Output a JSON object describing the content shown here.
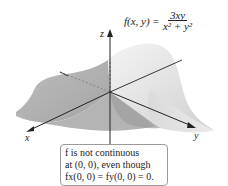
{
  "figure": {
    "title_formula": {
      "lhs": "f(x, y)",
      "eq": "=",
      "numerator": "3xy",
      "denominator": "x² + y²"
    },
    "axes": {
      "x": "x",
      "y": "y",
      "z": "z"
    },
    "caption": {
      "line1": "f is not continuous",
      "line2": "at (0, 0), even though",
      "line3": "fx(0, 0) = fy(0, 0) = 0."
    },
    "colors": {
      "surface_light": "#ececec",
      "surface_mid": "#c8c8c8",
      "surface_dark": "#a8a8a8",
      "axis": "#222222",
      "caption_border": "#9a9a9a"
    }
  }
}
